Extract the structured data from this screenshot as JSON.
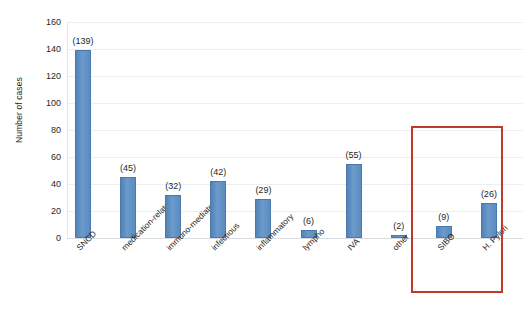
{
  "chart_data": {
    "type": "bar",
    "title": "",
    "xlabel": "",
    "ylabel": "Number of cases",
    "ylim": [
      0,
      160
    ],
    "yticks": [
      0,
      20,
      40,
      60,
      80,
      100,
      120,
      140,
      160
    ],
    "grid": true,
    "legend": "none",
    "bar_color": "#5b8cc0",
    "label_format": "(value)",
    "categories": [
      "SNCD",
      "medication-related",
      "immuno-mediated",
      "infectious",
      "inflammatory",
      "lympho",
      "IVA",
      "other",
      "SIBO",
      "H. Pylori"
    ],
    "values": [
      139,
      45,
      32,
      42,
      29,
      6,
      55,
      2,
      9,
      26
    ],
    "data_labels": [
      "(139)",
      "(45)",
      "(32)",
      "(42)",
      "(29)",
      "(6)",
      "(55)",
      "(2)",
      "(9)",
      "(26)"
    ],
    "annotations": [
      {
        "type": "rectangle",
        "name": "highlight-rectangle",
        "color": "#c0392b",
        "covers": [
          "SIBO",
          "H. Pylori"
        ]
      }
    ]
  },
  "axis": {
    "y_title": "Number of cases",
    "y_tick_labels": [
      "160",
      "140",
      "120",
      "100",
      "80",
      "60",
      "40",
      "20",
      "0"
    ]
  }
}
